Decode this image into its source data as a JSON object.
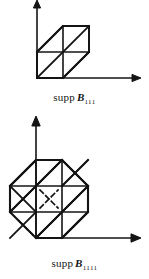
{
  "page": {
    "background": "#ffffff",
    "ink": "#141414",
    "width": 149,
    "height": 279
  },
  "figures": [
    {
      "id": "supp-b111",
      "caption": {
        "prefix": "supp",
        "symbol": "B",
        "subscript": "111",
        "full_text": "supp B111"
      },
      "axes": {
        "origin_label": "",
        "x_axis": "horizontal-arrow-right",
        "y_axis": "vertical-arrow-up",
        "arrowheads": [
          "x-positive",
          "y-positive"
        ]
      },
      "shape": {
        "type": "parallelogram",
        "description": "two-direction box spline support, 2x2 slanted cells with diagonals",
        "unit": 26,
        "outline_vertices": [
          [
            0,
            0
          ],
          [
            1,
            0
          ],
          [
            2,
            1
          ],
          [
            2,
            2
          ],
          [
            1,
            2
          ],
          [
            0,
            1
          ]
        ],
        "grid_lines": [
          [
            [
              0,
              1
            ],
            [
              2,
              1
            ]
          ],
          [
            [
              1,
              0
            ],
            [
              1,
              2
            ]
          ]
        ],
        "diagonals": [
          [
            [
              0,
              0
            ],
            [
              2,
              2
            ]
          ],
          [
            [
              0,
              1
            ],
            [
              1,
              2
            ]
          ],
          [
            [
              1,
              0
            ],
            [
              2,
              1
            ]
          ]
        ]
      }
    },
    {
      "id": "supp-b1111",
      "caption": {
        "prefix": "supp",
        "symbol": "B",
        "subscript": "1111",
        "full_text": "supp B1111"
      },
      "axes": {
        "origin_label": "",
        "x_axis": "horizontal-arrow-right",
        "y_axis": "vertical-arrow-up",
        "arrowheads": [
          "x-positive",
          "y-positive"
        ]
      },
      "shape": {
        "type": "octagon",
        "description": "four-direction box spline support, octagon over 3x3 cells with solid and dashed diagonals",
        "unit": 26,
        "outline_vertices": [
          [
            1,
            0
          ],
          [
            2,
            0
          ],
          [
            3,
            1
          ],
          [
            3,
            2
          ],
          [
            2,
            3
          ],
          [
            1,
            3
          ],
          [
            0,
            2
          ],
          [
            0,
            1
          ]
        ],
        "grid_lines": [
          [
            [
              0,
              1
            ],
            [
              3,
              1
            ]
          ],
          [
            [
              0,
              2
            ],
            [
              3,
              2
            ]
          ],
          [
            [
              1,
              0
            ],
            [
              1,
              3
            ]
          ],
          [
            [
              2,
              0
            ],
            [
              2,
              3
            ]
          ]
        ],
        "solid_diagonals": [
          [
            [
              0,
              1
            ],
            [
              1,
              0
            ]
          ],
          [
            [
              0,
              2
            ],
            [
              2,
              0
            ]
          ],
          [
            [
              1,
              3
            ],
            [
              3,
              1
            ]
          ],
          [
            [
              2,
              3
            ],
            [
              3,
              2
            ]
          ],
          [
            [
              1,
              0
            ],
            [
              0,
              1
            ]
          ],
          [
            [
              0,
              1
            ],
            [
              2,
              3
            ]
          ],
          [
            [
              1,
              0
            ],
            [
              3,
              2
            ]
          ],
          [
            [
              2,
              0
            ],
            [
              0,
              2
            ]
          ],
          [
            [
              3,
              1
            ],
            [
              1,
              3
            ]
          ],
          [
            [
              3,
              2
            ],
            [
              2,
              3
            ]
          ],
          [
            [
              1,
              0
            ],
            [
              2,
              1
            ]
          ],
          [
            [
              2,
              1
            ],
            [
              3,
              2
            ]
          ],
          [
            [
              0,
              2
            ],
            [
              1,
              3
            ]
          ]
        ],
        "dashed_diagonals": [
          [
            [
              0.5,
              2.5
            ],
            [
              1.0,
              3.0
            ]
          ],
          [
            [
              2.0,
              3.0
            ],
            [
              2.5,
              2.5
            ]
          ],
          [
            [
              1.2,
              1.8
            ],
            [
              1.8,
              1.2
            ]
          ],
          [
            [
              1.2,
              1.2
            ],
            [
              1.8,
              1.8
            ]
          ],
          [
            [
              0.5,
              0.5
            ],
            [
              1.0,
              0.0
            ]
          ],
          [
            [
              2.0,
              0.0
            ],
            [
              2.5,
              0.5
            ]
          ]
        ]
      }
    }
  ]
}
